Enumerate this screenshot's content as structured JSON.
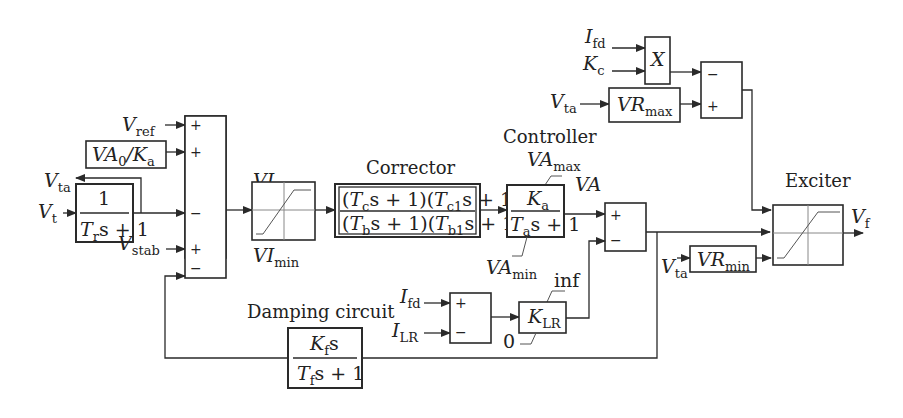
{
  "diagram": {
    "blocks": {
      "transducer": {
        "num": "1",
        "den_T": "T",
        "den_sub": "r",
        "den_rest": "s + 1"
      },
      "va0_ka": {
        "a": "VA",
        "a_sub": "0",
        "slash": "/",
        "b": "K",
        "b_sub": "a"
      },
      "summer1": {
        "signs": [
          "+",
          "+",
          "−",
          "+",
          "−"
        ]
      },
      "vi_limiter": {
        "max_main": "VI",
        "max_sub": "max",
        "min_main": "VI",
        "min_sub": "min"
      },
      "corrector": {
        "label": "Corrector",
        "num": "(T s + 1)(T  s + 1)",
        "num_parts": [
          "(",
          "T",
          "c",
          "s + 1)(",
          "T",
          "c1",
          "s + 1)"
        ],
        "den_parts": [
          "(",
          "T",
          "b",
          "s + 1)(",
          "T",
          "b1",
          "s + 1)"
        ]
      },
      "controller": {
        "label": "Controller",
        "num": "K",
        "num_sub": "a",
        "den_T": "T",
        "den_sub": "a",
        "den_rest": "s + 1",
        "max_main": "VA",
        "max_sub": "max",
        "min_main": "VA",
        "min_sub": "min",
        "output": "VA"
      },
      "summer2": {
        "signs": [
          "+",
          "−"
        ]
      },
      "multiplier": {
        "label": "X",
        "in1": "I",
        "in1_sub": "fd",
        "in2": "K",
        "in2_sub": "c"
      },
      "vr_max": {
        "main": "VR",
        "sub": "max",
        "input": "V",
        "input_sub": "ta"
      },
      "summer3": {
        "signs": [
          "−",
          "+"
        ]
      },
      "exciter": {
        "label": "Exciter",
        "output": "V",
        "output_sub": "f"
      },
      "vr_min": {
        "main": "VR",
        "sub": "min",
        "input": "V",
        "input_sub": "ta"
      },
      "damping": {
        "label": "Damping circuit",
        "num": "K",
        "num_sub": "f",
        "num_rest": "s",
        "den_T": "T",
        "den_sub": "f",
        "den_rest": "s + 1"
      },
      "summer4": {
        "signs": [
          "+",
          "−"
        ],
        "in1": "I",
        "in1_sub": "fd",
        "in2": "I",
        "in2_sub": "LR"
      },
      "klr": {
        "main": "K",
        "sub": "LR",
        "upper": "inf",
        "lower": "0"
      }
    },
    "signals": {
      "vref": {
        "main": "V",
        "sub": "ref"
      },
      "vt": {
        "main": "V",
        "sub": "t"
      },
      "vta": {
        "main": "V",
        "sub": "ta"
      },
      "vstab": {
        "main": "V",
        "sub": "stab"
      }
    }
  }
}
